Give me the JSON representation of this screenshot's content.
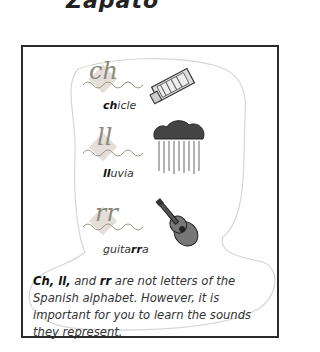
{
  "top_word": "Zapato",
  "items": [
    {
      "digraph": "ch",
      "word_bold": "ch",
      "word_rest": "icle",
      "picture": "gum-pack-icon"
    },
    {
      "digraph": "ll",
      "word_bold": "ll",
      "word_rest": "uvia",
      "picture": "rain-cloud-icon"
    },
    {
      "digraph": "rr",
      "word_prefix": "guita",
      "word_bold": "rr",
      "word_rest": "a",
      "picture": "guitar-icon"
    }
  ],
  "note": {
    "bold1": "Ch, ll,",
    "text1": " and ",
    "bold2": "rr",
    "text2": " are not letters of the Spanish alphabet. However, it is important for you to learn the sounds they represent."
  }
}
